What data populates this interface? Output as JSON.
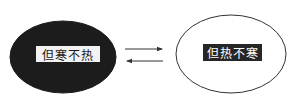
{
  "diagram": {
    "nodes": [
      {
        "id": "left",
        "label": "但寒不热",
        "fill": "#1c1c1c",
        "stroke": "#1c1c1c",
        "label_bg": "#f2f2f2",
        "label_color": "#1a1a1a"
      },
      {
        "id": "right",
        "label": "但热不寒",
        "fill": "#ffffff",
        "stroke": "#333333",
        "label_bg": "#262626",
        "label_color": "#ffffff"
      }
    ],
    "edges": [
      {
        "from": "left",
        "to": "right",
        "direction": "right"
      },
      {
        "from": "right",
        "to": "left",
        "direction": "left"
      }
    ]
  }
}
